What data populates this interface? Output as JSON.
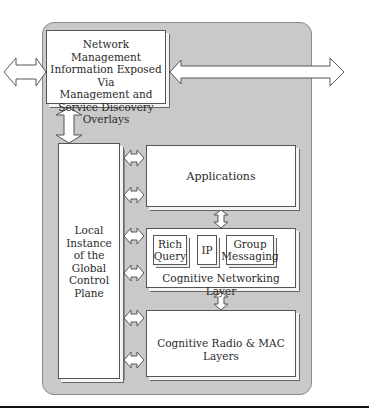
{
  "diagram": {
    "top_box": {
      "lines": [
        "Network Management",
        "Information Exposed Via",
        "Management and",
        "Service Discovery",
        "Overlays"
      ]
    },
    "control_plane": {
      "lines": [
        "Local",
        "Instance",
        "of the",
        "Global",
        "Control",
        "Plane"
      ]
    },
    "layers": {
      "applications": "Applications",
      "cognitive_networking": {
        "label": "Cognitive Networking Layer",
        "modules": [
          {
            "lines": [
              "Rich",
              "Query"
            ]
          },
          {
            "lines": [
              "IP"
            ]
          },
          {
            "lines": [
              "Group",
              "Messaging"
            ]
          }
        ]
      },
      "cognitive_radio": "Cognitive Radio & MAC Layers"
    },
    "colors": {
      "panel": "#c9c9c9",
      "box": "#ffffff",
      "outline": "#555555",
      "rule": "#111111"
    }
  }
}
